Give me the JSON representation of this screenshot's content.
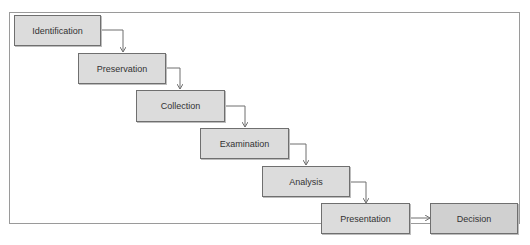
{
  "diagram": {
    "type": "flow",
    "direction": "cascading-down-right",
    "nodes": [
      {
        "id": "identification",
        "label": "Identification"
      },
      {
        "id": "preservation",
        "label": "Preservation"
      },
      {
        "id": "collection",
        "label": "Collection"
      },
      {
        "id": "examination",
        "label": "Examination"
      },
      {
        "id": "analysis",
        "label": "Analysis"
      },
      {
        "id": "presentation",
        "label": "Presentation"
      },
      {
        "id": "decision",
        "label": "Decision"
      }
    ],
    "edges": [
      {
        "from": "identification",
        "to": "preservation"
      },
      {
        "from": "preservation",
        "to": "collection"
      },
      {
        "from": "collection",
        "to": "examination"
      },
      {
        "from": "examination",
        "to": "analysis"
      },
      {
        "from": "analysis",
        "to": "presentation"
      },
      {
        "from": "presentation",
        "to": "decision"
      }
    ],
    "colors": {
      "node_fill": "#dcdcdc",
      "node_border": "#6f6f6f",
      "edge": "#6f6f6f",
      "frame": "#9a9a9a"
    }
  }
}
